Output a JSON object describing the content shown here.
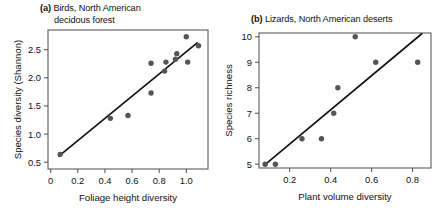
{
  "figure": {
    "background": "#ffffff",
    "point_color": "#555555",
    "line_color": "#141414",
    "frame_color": "#4d4d4d"
  },
  "chart_data": [
    {
      "type": "scatter",
      "panel": "a",
      "panel_tag": "(a)",
      "title": "Birds, North American decidous forest",
      "title_line1": "Birds, North American",
      "title_line2": "decidous forest",
      "xlabel": "Foliage height diversity",
      "ylabel": "Species diversity (Shannon)",
      "xlim": [
        -0.02,
        1.16
      ],
      "ylim": [
        0.38,
        2.85
      ],
      "xticks": [
        0,
        0.2,
        0.4,
        0.6,
        0.8,
        1.0
      ],
      "xticklabels": [
        "0",
        "0.2",
        "0.4",
        "0.6",
        "0.8",
        "1.0"
      ],
      "yticks": [
        0.5,
        1.0,
        1.5,
        2.0,
        2.5
      ],
      "yticklabels": [
        "0.5",
        "1.0",
        "1.5",
        "2.0",
        "2.5"
      ],
      "grid": false,
      "legend": "none",
      "points": [
        {
          "x": 0.07,
          "y": 0.64
        },
        {
          "x": 0.44,
          "y": 1.28
        },
        {
          "x": 0.57,
          "y": 1.33
        },
        {
          "x": 0.74,
          "y": 1.73
        },
        {
          "x": 0.74,
          "y": 2.26
        },
        {
          "x": 0.84,
          "y": 2.12
        },
        {
          "x": 0.85,
          "y": 2.28
        },
        {
          "x": 0.92,
          "y": 2.33
        },
        {
          "x": 0.93,
          "y": 2.43
        },
        {
          "x": 1.0,
          "y": 2.73
        },
        {
          "x": 1.01,
          "y": 2.28
        },
        {
          "x": 1.09,
          "y": 2.57
        }
      ],
      "fit_line": {
        "x1": 0.06,
        "y1": 0.61,
        "x2": 1.08,
        "y2": 2.62
      }
    },
    {
      "type": "scatter",
      "panel": "b",
      "panel_tag": "(b)",
      "title": "Lizards, North American deserts",
      "title_line1": "Lizards, North American deserts",
      "xlabel": "Plant volume diversity",
      "ylabel": "Species richness",
      "xlim": [
        0.05,
        0.89
      ],
      "ylim": [
        4.85,
        10.15
      ],
      "xticks": [
        0.2,
        0.4,
        0.6,
        0.8
      ],
      "xticklabels": [
        "0.2",
        "0.4",
        "0.6",
        "0.8"
      ],
      "yticks": [
        5,
        6,
        7,
        8,
        9,
        10
      ],
      "yticklabels": [
        "5",
        "6",
        "7",
        "8",
        "9",
        "10"
      ],
      "grid": false,
      "legend": "none",
      "points": [
        {
          "x": 0.08,
          "y": 5.0
        },
        {
          "x": 0.13,
          "y": 5.0
        },
        {
          "x": 0.26,
          "y": 6.0
        },
        {
          "x": 0.355,
          "y": 6.0
        },
        {
          "x": 0.415,
          "y": 7.0
        },
        {
          "x": 0.435,
          "y": 8.0
        },
        {
          "x": 0.52,
          "y": 10.0
        },
        {
          "x": 0.62,
          "y": 9.0
        },
        {
          "x": 0.825,
          "y": 9.0
        }
      ],
      "fit_line": {
        "x1": 0.075,
        "y1": 4.95,
        "x2": 0.845,
        "y2": 10.12
      }
    }
  ]
}
